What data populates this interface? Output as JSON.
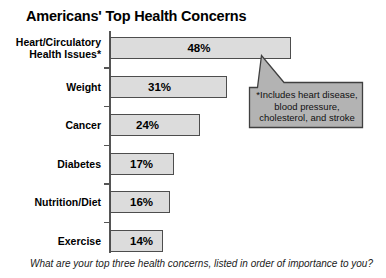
{
  "chart_data": {
    "type": "bar",
    "orientation": "horizontal",
    "title": "Americans' Top Health Concerns",
    "xlabel": "",
    "ylabel": "",
    "xlim": [
      0,
      48
    ],
    "grid": false,
    "legend": null,
    "categories": [
      "Heart/Circulatory\nHealth Issues*",
      "Weight",
      "Cancer",
      "Diabetes",
      "Nutrition/Diet",
      "Exercise"
    ],
    "values": [
      48,
      31,
      24,
      17,
      16,
      14
    ],
    "value_labels": [
      "48%",
      "31%",
      "24%",
      "17%",
      "16%",
      "14%"
    ],
    "annotations": [
      {
        "name": "footnote-callout",
        "text": "*Includes heart disease, blood pressure, cholesterol, and stroke",
        "lines": [
          "*Includes heart disease,",
          "blood pressure,",
          "cholesterol, and stroke"
        ],
        "points_to": "Heart/Circulatory Health Issues*"
      },
      {
        "name": "survey-question",
        "text": "What are your top three health concerns, listed in order of importance to you?"
      }
    ],
    "colors": {
      "bar_fill": "#dcdcdc",
      "bar_border": "#4d4d4d",
      "callout_fill": "#b3b3b3",
      "callout_border": "#404040",
      "axis": "#555555",
      "text": "#000000",
      "background": "#ffffff"
    }
  },
  "footer": {
    "question": "What are your top three health concerns, listed in order of importance to you?"
  }
}
